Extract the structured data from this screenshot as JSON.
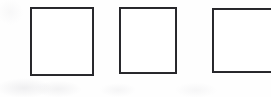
{
  "document": {
    "kind": "scanned-form-fragment",
    "description": "Three empty square checkboxes in a horizontal row on scanned paper",
    "background_color": "#fefefe",
    "ink_color": "#26262a",
    "width": 271,
    "height": 97
  },
  "checkboxes": {
    "count": 3,
    "checked_count": 0,
    "state_label": "unchecked",
    "items": [
      {
        "name": "checkbox-1",
        "state": "unchecked",
        "value": "",
        "x": 30,
        "y": 7,
        "width": 64,
        "height": 69,
        "stroke_width": 2,
        "clipped": false
      },
      {
        "name": "checkbox-2",
        "state": "unchecked",
        "value": "",
        "x": 119,
        "y": 7,
        "width": 58,
        "height": 67,
        "stroke_width": 2,
        "clipped": false
      },
      {
        "name": "checkbox-3",
        "state": "unchecked",
        "value": "",
        "x": 212,
        "y": 8,
        "width": 62,
        "height": 65,
        "stroke_width": 2,
        "clipped": true
      }
    ]
  }
}
